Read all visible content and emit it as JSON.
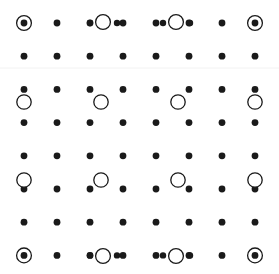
{
  "canvas": {
    "width": 279,
    "height": 274,
    "background_color": "#ffffff",
    "title": "Dot Grid Pattern"
  },
  "style": {
    "dot_color": "#1a1a1a",
    "dot_radius": 3.4,
    "ring_color": "#1a1a1a",
    "ring_stroke": 1.3,
    "open_circle_radius": 7.2,
    "open_circle_fill": "#ffffff",
    "marker_ring_radius": 7.4,
    "divider_color": "#f2f2f2",
    "divider_stroke": 1
  },
  "grid": {
    "columns": 8,
    "rows": 8,
    "x_start": 24,
    "x_step": 33,
    "y_start": 23,
    "y_step": 33.2,
    "x_positions": [
      24,
      57,
      90,
      123,
      156,
      189,
      222,
      255
    ],
    "y_positions": [
      23,
      56.2,
      89.4,
      122.6,
      155.8,
      189,
      222.2,
      255.4
    ]
  },
  "dividers": [
    {
      "name": "divider-upper",
      "y": 68,
      "x1": 0,
      "x2": 279
    }
  ],
  "dots": [
    {
      "id": "dot-r1c1",
      "col": 1,
      "row": 1,
      "x": 24,
      "y": 23
    },
    {
      "id": "dot-r1c2",
      "col": 2,
      "row": 1,
      "x": 57,
      "y": 23
    },
    {
      "id": "dot-r1c3",
      "col": 3,
      "row": 1,
      "x": 90,
      "y": 23
    },
    {
      "id": "dot-r1c4",
      "col": 4,
      "row": 1,
      "x": 123,
      "y": 23
    },
    {
      "id": "dot-r1c5",
      "col": 5,
      "row": 1,
      "x": 156,
      "y": 23
    },
    {
      "id": "dot-r1c6",
      "col": 6,
      "row": 1,
      "x": 189,
      "y": 23
    },
    {
      "id": "dot-r1c7",
      "col": 7,
      "row": 1,
      "x": 222,
      "y": 23
    },
    {
      "id": "dot-r1c8",
      "col": 8,
      "row": 1,
      "x": 255,
      "y": 23
    },
    {
      "id": "dot-r2c1",
      "col": 1,
      "row": 2,
      "x": 24,
      "y": 56.2
    },
    {
      "id": "dot-r2c2",
      "col": 2,
      "row": 2,
      "x": 57,
      "y": 56.2
    },
    {
      "id": "dot-r2c3",
      "col": 3,
      "row": 2,
      "x": 90,
      "y": 56.2
    },
    {
      "id": "dot-r2c4",
      "col": 4,
      "row": 2,
      "x": 123,
      "y": 56.2
    },
    {
      "id": "dot-r2c5",
      "col": 5,
      "row": 2,
      "x": 156,
      "y": 56.2
    },
    {
      "id": "dot-r2c6",
      "col": 6,
      "row": 2,
      "x": 189,
      "y": 56.2
    },
    {
      "id": "dot-r2c7",
      "col": 7,
      "row": 2,
      "x": 222,
      "y": 56.2
    },
    {
      "id": "dot-r2c8",
      "col": 8,
      "row": 2,
      "x": 255,
      "y": 56.2
    },
    {
      "id": "dot-r3c1",
      "col": 1,
      "row": 3,
      "x": 24,
      "y": 89.4
    },
    {
      "id": "dot-r3c2",
      "col": 2,
      "row": 3,
      "x": 57,
      "y": 89.4
    },
    {
      "id": "dot-r3c3",
      "col": 3,
      "row": 3,
      "x": 90,
      "y": 89.4
    },
    {
      "id": "dot-r3c4",
      "col": 4,
      "row": 3,
      "x": 123,
      "y": 89.4
    },
    {
      "id": "dot-r3c5",
      "col": 5,
      "row": 3,
      "x": 156,
      "y": 89.4
    },
    {
      "id": "dot-r3c6",
      "col": 6,
      "row": 3,
      "x": 189,
      "y": 89.4
    },
    {
      "id": "dot-r3c7",
      "col": 7,
      "row": 3,
      "x": 222,
      "y": 89.4
    },
    {
      "id": "dot-r3c8",
      "col": 8,
      "row": 3,
      "x": 255,
      "y": 89.4
    },
    {
      "id": "dot-r4c1",
      "col": 1,
      "row": 4,
      "x": 24,
      "y": 122.6
    },
    {
      "id": "dot-r4c2",
      "col": 2,
      "row": 4,
      "x": 57,
      "y": 122.6
    },
    {
      "id": "dot-r4c3",
      "col": 3,
      "row": 4,
      "x": 90,
      "y": 122.6
    },
    {
      "id": "dot-r4c4",
      "col": 4,
      "row": 4,
      "x": 123,
      "y": 122.6
    },
    {
      "id": "dot-r4c5",
      "col": 5,
      "row": 4,
      "x": 156,
      "y": 122.6
    },
    {
      "id": "dot-r4c6",
      "col": 6,
      "row": 4,
      "x": 189,
      "y": 122.6
    },
    {
      "id": "dot-r4c7",
      "col": 7,
      "row": 4,
      "x": 222,
      "y": 122.6
    },
    {
      "id": "dot-r4c8",
      "col": 8,
      "row": 4,
      "x": 255,
      "y": 122.6
    },
    {
      "id": "dot-r5c1",
      "col": 1,
      "row": 5,
      "x": 24,
      "y": 155.8
    },
    {
      "id": "dot-r5c2",
      "col": 2,
      "row": 5,
      "x": 57,
      "y": 155.8
    },
    {
      "id": "dot-r5c3",
      "col": 3,
      "row": 5,
      "x": 90,
      "y": 155.8
    },
    {
      "id": "dot-r5c4",
      "col": 4,
      "row": 5,
      "x": 123,
      "y": 155.8
    },
    {
      "id": "dot-r5c5",
      "col": 5,
      "row": 5,
      "x": 156,
      "y": 155.8
    },
    {
      "id": "dot-r5c6",
      "col": 6,
      "row": 5,
      "x": 189,
      "y": 155.8
    },
    {
      "id": "dot-r5c7",
      "col": 7,
      "row": 5,
      "x": 222,
      "y": 155.8
    },
    {
      "id": "dot-r5c8",
      "col": 8,
      "row": 5,
      "x": 255,
      "y": 155.8
    },
    {
      "id": "dot-r6c1",
      "col": 1,
      "row": 6,
      "x": 24,
      "y": 189
    },
    {
      "id": "dot-r6c2",
      "col": 2,
      "row": 6,
      "x": 57,
      "y": 189
    },
    {
      "id": "dot-r6c3",
      "col": 3,
      "row": 6,
      "x": 90,
      "y": 189
    },
    {
      "id": "dot-r6c4",
      "col": 4,
      "row": 6,
      "x": 123,
      "y": 189
    },
    {
      "id": "dot-r6c5",
      "col": 5,
      "row": 6,
      "x": 156,
      "y": 189
    },
    {
      "id": "dot-r6c6",
      "col": 6,
      "row": 6,
      "x": 189,
      "y": 189
    },
    {
      "id": "dot-r6c7",
      "col": 7,
      "row": 6,
      "x": 222,
      "y": 189
    },
    {
      "id": "dot-r6c8",
      "col": 8,
      "row": 6,
      "x": 255,
      "y": 189
    },
    {
      "id": "dot-r7c1",
      "col": 1,
      "row": 7,
      "x": 24,
      "y": 222.2
    },
    {
      "id": "dot-r7c2",
      "col": 2,
      "row": 7,
      "x": 57,
      "y": 222.2
    },
    {
      "id": "dot-r7c3",
      "col": 3,
      "row": 7,
      "x": 90,
      "y": 222.2
    },
    {
      "id": "dot-r7c4",
      "col": 4,
      "row": 7,
      "x": 123,
      "y": 222.2
    },
    {
      "id": "dot-r7c5",
      "col": 5,
      "row": 7,
      "x": 156,
      "y": 222.2
    },
    {
      "id": "dot-r7c6",
      "col": 6,
      "row": 7,
      "x": 189,
      "y": 222.2
    },
    {
      "id": "dot-r7c7",
      "col": 7,
      "row": 7,
      "x": 222,
      "y": 222.2
    },
    {
      "id": "dot-r7c8",
      "col": 8,
      "row": 7,
      "x": 255,
      "y": 222.2
    },
    {
      "id": "dot-r8c1",
      "col": 1,
      "row": 8,
      "x": 24,
      "y": 255.4
    },
    {
      "id": "dot-r8c2",
      "col": 2,
      "row": 8,
      "x": 57,
      "y": 255.4
    },
    {
      "id": "dot-r8c3",
      "col": 3,
      "row": 8,
      "x": 90,
      "y": 255.4
    },
    {
      "id": "dot-r8c4",
      "col": 4,
      "row": 8,
      "x": 123,
      "y": 255.4
    },
    {
      "id": "dot-r8c5",
      "col": 5,
      "row": 8,
      "x": 156,
      "y": 255.4
    },
    {
      "id": "dot-r8c6",
      "col": 6,
      "row": 8,
      "x": 189,
      "y": 255.4
    },
    {
      "id": "dot-r8c7",
      "col": 7,
      "row": 8,
      "x": 222,
      "y": 255.4
    },
    {
      "id": "dot-r8c8",
      "col": 8,
      "row": 8,
      "x": 255,
      "y": 255.4
    }
  ],
  "open_circles": [
    {
      "id": "circle-top-left-inner",
      "x": 103,
      "y": 22,
      "r": 7.4
    },
    {
      "id": "circle-top-right-inner",
      "x": 176,
      "y": 22,
      "r": 7.4
    },
    {
      "id": "circle-band2-col1",
      "x": 24,
      "y": 102,
      "r": 7.2
    },
    {
      "id": "circle-band2-col3",
      "x": 101,
      "y": 102,
      "r": 7.2
    },
    {
      "id": "circle-band2-col6",
      "x": 178,
      "y": 102,
      "r": 7.2
    },
    {
      "id": "circle-band2-col8",
      "x": 255,
      "y": 102,
      "r": 7.2
    },
    {
      "id": "circle-band3-col1",
      "x": 24,
      "y": 180,
      "r": 7.2
    },
    {
      "id": "circle-band3-col3",
      "x": 101,
      "y": 180,
      "r": 7.2
    },
    {
      "id": "circle-band3-col6",
      "x": 178,
      "y": 180,
      "r": 7.2
    },
    {
      "id": "circle-band3-col8",
      "x": 255,
      "y": 180,
      "r": 7.2
    },
    {
      "id": "circle-bottom-left-inner",
      "x": 103,
      "y": 256,
      "r": 7.4
    },
    {
      "id": "circle-bottom-right-inner",
      "x": 176,
      "y": 256,
      "r": 7.4
    }
  ],
  "ringed_markers": [
    {
      "id": "marker-corner-top-left",
      "corner": "top-left",
      "x": 24,
      "y": 23,
      "r": 7.4
    },
    {
      "id": "marker-corner-top-right",
      "corner": "top-right",
      "x": 255,
      "y": 23,
      "r": 7.4
    },
    {
      "id": "marker-corner-bottom-left",
      "corner": "bottom-left",
      "x": 24,
      "y": 255.4,
      "r": 7.4
    },
    {
      "id": "marker-corner-bottom-right",
      "corner": "bottom-right",
      "x": 255,
      "y": 255.4,
      "r": 7.4
    }
  ],
  "satellite_dots": [
    {
      "id": "sat-top-a",
      "x": 90,
      "y": 23,
      "r": 3.2
    },
    {
      "id": "sat-top-b",
      "x": 117,
      "y": 23,
      "r": 3.2
    },
    {
      "id": "sat-top-c",
      "x": 163,
      "y": 23,
      "r": 3.2
    },
    {
      "id": "sat-top-d",
      "x": 190,
      "y": 23,
      "r": 3.2
    },
    {
      "id": "sat-bot-a",
      "x": 90,
      "y": 255.4,
      "r": 3.2
    },
    {
      "id": "sat-bot-b",
      "x": 117,
      "y": 255.4,
      "r": 3.2
    },
    {
      "id": "sat-bot-c",
      "x": 163,
      "y": 255.4,
      "r": 3.2
    },
    {
      "id": "sat-bot-d",
      "x": 190,
      "y": 255.4,
      "r": 3.2
    }
  ]
}
